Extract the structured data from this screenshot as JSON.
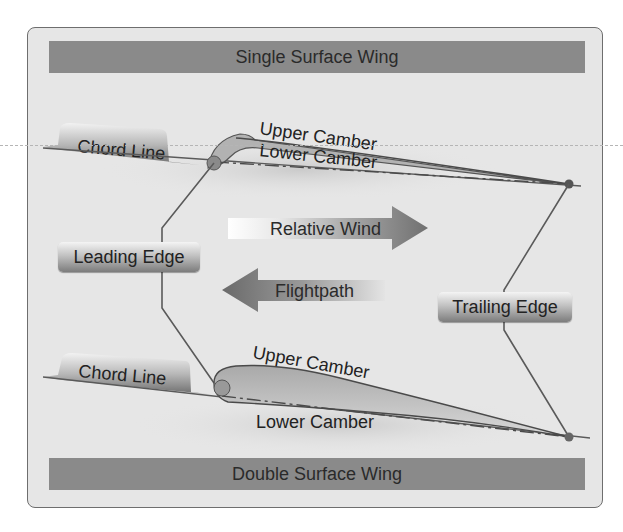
{
  "diagram": {
    "top_title": "Single Surface Wing",
    "bottom_title": "Double Surface Wing",
    "single_surface": {
      "chord_line": "Chord Line",
      "upper_camber": "Upper Camber",
      "lower_camber": "Lower Camber"
    },
    "double_surface": {
      "chord_line": "Chord Line",
      "upper_camber": "Upper Camber",
      "lower_camber": "Lower Camber"
    },
    "leading_edge": "Leading Edge",
    "trailing_edge": "Trailing Edge",
    "relative_wind": "Relative Wind",
    "flightpath": "Flightpath",
    "colors": {
      "frame_bg": "#e6e6e6",
      "bar_bg": "#8a8a8a",
      "line": "#5a5a5a",
      "text": "#222222"
    }
  }
}
